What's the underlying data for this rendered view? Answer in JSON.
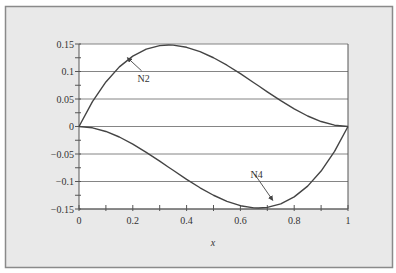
{
  "chart_data": {
    "type": "line",
    "title": "",
    "xlabel": "x",
    "ylabel": "",
    "xlim": [
      0,
      1
    ],
    "ylim": [
      -0.15,
      0.15
    ],
    "grid": {
      "horizontal": true,
      "vertical": false
    },
    "legend": null,
    "x_ticks": [
      0,
      0.2,
      0.4,
      0.6,
      0.8,
      1
    ],
    "x_tick_labels": [
      "0",
      "0.2",
      "0.4",
      "0.6",
      "0.8",
      "1"
    ],
    "x_minor_step": 0.1,
    "y_ticks": [
      0.15,
      0.1,
      0.05,
      0,
      -0.05,
      -0.1,
      -0.15
    ],
    "y_tick_labels": [
      "0.15",
      "0.1",
      "0.05",
      "0",
      "-0.05",
      "-0.1",
      "-0.15"
    ],
    "y_minor_step": 0.025,
    "x": [
      0,
      0.05,
      0.1,
      0.15,
      0.2,
      0.25,
      0.3,
      0.333,
      0.35,
      0.4,
      0.45,
      0.5,
      0.55,
      0.6,
      0.65,
      0.667,
      0.7,
      0.75,
      0.8,
      0.85,
      0.9,
      0.95,
      1
    ],
    "series": [
      {
        "name": "N2",
        "formula": "x(1-x)^2",
        "values": [
          0,
          0.0451,
          0.081,
          0.1084,
          0.128,
          0.1406,
          0.147,
          0.1481,
          0.1479,
          0.144,
          0.1361,
          0.125,
          0.1114,
          0.096,
          0.0796,
          0.0741,
          0.063,
          0.0469,
          0.032,
          0.0191,
          0.009,
          0.0024,
          0
        ]
      },
      {
        "name": "N4",
        "formula": "-x^2(1-x)",
        "values": [
          0,
          -0.0024,
          -0.009,
          -0.0191,
          -0.032,
          -0.0469,
          -0.063,
          -0.0741,
          -0.0796,
          -0.096,
          -0.1114,
          -0.125,
          -0.1361,
          -0.144,
          -0.1479,
          -0.1481,
          -0.147,
          -0.1406,
          -0.128,
          -0.1084,
          -0.081,
          -0.0451,
          0
        ]
      }
    ],
    "annotations": [
      {
        "text": "N2",
        "arrow_to": {
          "x": 0.18,
          "y": 0.125
        },
        "text_at": {
          "x": 0.24,
          "y": 0.085
        }
      },
      {
        "text": "N4",
        "arrow_to": {
          "x": 0.72,
          "y": -0.134
        },
        "text_at": {
          "x": 0.66,
          "y": -0.09
        }
      }
    ]
  },
  "colors": {
    "panel_bg": "#e9e9e9",
    "panel_border": "#8a8a8a",
    "plot_bg": "#ffffff",
    "axis": "#555555",
    "grid": "#777777",
    "curve": "#444444",
    "text": "#333333"
  }
}
